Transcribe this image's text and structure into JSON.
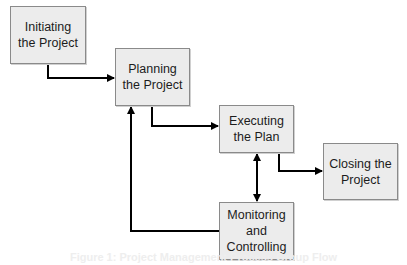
{
  "diagram": {
    "type": "flowchart",
    "nodes": [
      {
        "id": "initiating",
        "label": "Initiating\nthe Project"
      },
      {
        "id": "planning",
        "label": "Planning\nthe Project"
      },
      {
        "id": "executing",
        "label": "Executing\nthe Plan"
      },
      {
        "id": "closing",
        "label": "Closing the\nProject"
      },
      {
        "id": "monitoring",
        "label": "Monitoring\nand\nControlling"
      }
    ],
    "edges": [
      {
        "from": "initiating",
        "to": "planning",
        "direction": "forward"
      },
      {
        "from": "planning",
        "to": "executing",
        "direction": "forward"
      },
      {
        "from": "executing",
        "to": "closing",
        "direction": "forward"
      },
      {
        "from": "executing",
        "to": "monitoring",
        "direction": "bidirectional"
      },
      {
        "from": "monitoring",
        "to": "planning",
        "direction": "forward"
      }
    ],
    "colors": {
      "box_fill": "#ececec",
      "box_border": "#8a8a8a",
      "arrow": "#000000"
    }
  },
  "caption": "Figure 1: Project Management Process Group Flow"
}
